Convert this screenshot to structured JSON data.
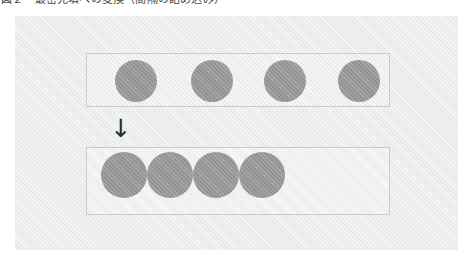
{
  "caption": {
    "text": "図２　最密充填への変換（間隔の詰め込み）"
  },
  "figure": {
    "name": "circle-packing-before-after",
    "background_color": "#eceded",
    "box_border_color": "#c9cccd",
    "circle_color": "#9b9b9b",
    "arrow_glyph": "↓",
    "arrow_label": "transform-down-arrow",
    "rows": [
      {
        "id": "before",
        "label": "spaced-row",
        "circle_count": 4,
        "circle_diameter": 42,
        "circles": [
          {
            "cx": 49,
            "cy": 27
          },
          {
            "cx": 125,
            "cy": 27
          },
          {
            "cx": 198,
            "cy": 27
          },
          {
            "cx": 272,
            "cy": 27
          }
        ]
      },
      {
        "id": "after",
        "label": "packed-row",
        "circle_count": 4,
        "circle_diameter": 46,
        "circles": [
          {
            "cx": 37,
            "cy": 27
          },
          {
            "cx": 83,
            "cy": 27
          },
          {
            "cx": 129,
            "cy": 27
          },
          {
            "cx": 175,
            "cy": 27
          }
        ]
      }
    ]
  }
}
